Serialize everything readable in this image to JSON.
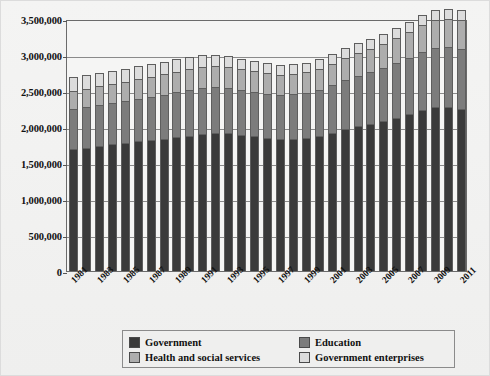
{
  "chart_data": {
    "type": "bar",
    "stacked": true,
    "title": "",
    "subtitle": "",
    "xlabel": "",
    "ylabel": "",
    "ylim": [
      0,
      3500000
    ],
    "ytick_step": 500000,
    "ytick_labels": [
      "0",
      "500,000",
      "1,000,000",
      "1,500,000",
      "2,000,000",
      "2,500,000",
      "3,000,000",
      "3,500,000"
    ],
    "ytick_values": [
      0,
      500000,
      1000000,
      1500000,
      2000000,
      2500000,
      3000000,
      3500000
    ],
    "grid": true,
    "legend_position": "bottom",
    "categories": [
      "1981",
      "1982",
      "1983",
      "1984",
      "1985",
      "1986",
      "1987",
      "1988",
      "1989",
      "1990",
      "1991",
      "1992",
      "1993",
      "1994",
      "1995",
      "1996",
      "1997",
      "1998",
      "1999",
      "2000",
      "2001",
      "2002",
      "2003",
      "2004",
      "2005",
      "2006",
      "2007",
      "2008",
      "2009",
      "2010",
      "2011"
    ],
    "tick_labels": [
      "1981",
      "1983",
      "1985",
      "1987",
      "1989",
      "1991",
      "1993",
      "1995",
      "1997",
      "1999",
      "2001",
      "2003",
      "2005",
      "2007",
      "2009",
      "2011"
    ],
    "series": [
      {
        "name": "Government",
        "color": "#3a3a3a",
        "values": [
          1690000,
          1710000,
          1740000,
          1760000,
          1780000,
          1800000,
          1820000,
          1840000,
          1860000,
          1880000,
          1900000,
          1910000,
          1910000,
          1890000,
          1870000,
          1850000,
          1840000,
          1840000,
          1850000,
          1880000,
          1920000,
          1970000,
          2010000,
          2040000,
          2080000,
          2130000,
          2180000,
          2240000,
          2280000,
          2280000,
          2250000
        ]
      },
      {
        "name": "Education",
        "color": "#7c7c7c",
        "values": [
          560000,
          565000,
          570000,
          575000,
          580000,
          590000,
          600000,
          610000,
          620000,
          630000,
          640000,
          640000,
          635000,
          625000,
          620000,
          615000,
          610000,
          615000,
          625000,
          640000,
          660000,
          680000,
          700000,
          720000,
          740000,
          760000,
          780000,
          800000,
          820000,
          830000,
          840000
        ]
      },
      {
        "name": "Health and social services",
        "color": "#adadad",
        "values": [
          250000,
          255000,
          260000,
          265000,
          270000,
          275000,
          280000,
          285000,
          290000,
          295000,
          300000,
          300000,
          295000,
          290000,
          285000,
          280000,
          278000,
          280000,
          285000,
          292000,
          300000,
          310000,
          320000,
          330000,
          340000,
          350000,
          362000,
          375000,
          388000,
          395000,
          400000
        ]
      },
      {
        "name": "Government enterprises",
        "color": "#dcdcdc",
        "values": [
          190000,
          190000,
          185000,
          185000,
          180000,
          180000,
          175000,
          175000,
          170000,
          165000,
          160000,
          155000,
          150000,
          145000,
          140000,
          138000,
          136000,
          135000,
          135000,
          135000,
          135000,
          135000,
          135000,
          135000,
          135000,
          135000,
          135000,
          135000,
          135000,
          135000,
          135000
        ]
      }
    ],
    "totals": [
      2690000,
      2720000,
      2755000,
      2785000,
      2810000,
      2845000,
      2875000,
      2910000,
      2940000,
      2970000,
      3000000,
      3005000,
      2990000,
      2950000,
      2915000,
      2883000,
      2864000,
      2870000,
      2895000,
      2947000,
      3015000,
      3095000,
      3165000,
      3225000,
      3295000,
      3375000,
      3457000,
      3550000,
      3623000,
      3640000,
      3625000
    ]
  },
  "legend": {
    "items": [
      {
        "label": "Government",
        "color": "#3a3a3a"
      },
      {
        "label": "Education",
        "color": "#7c7c7c"
      },
      {
        "label": "Health and social services",
        "color": "#adadad"
      },
      {
        "label": "Government enterprises",
        "color": "#dcdcdc"
      }
    ]
  }
}
